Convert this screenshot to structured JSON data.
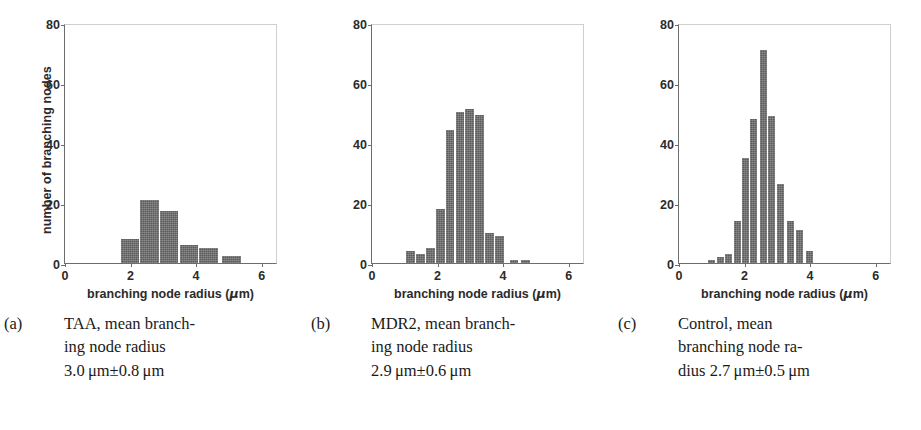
{
  "figure": {
    "panel_count": 3,
    "bar_color": "#5c5c5c",
    "axis_color": "#6d6d6d",
    "background": "#ffffff"
  },
  "axis": {
    "xlabel_prefix": "branching node radius (",
    "xlabel_mu": "μ",
    "xlabel_suffix": "m)",
    "ylabel": "number of branching nodes",
    "xticks": [
      "0",
      "2",
      "4",
      "6"
    ],
    "yticks": [
      "0",
      "20",
      "40",
      "60",
      "80"
    ]
  },
  "panels": [
    {
      "id": "taa",
      "caption_tag": "(a)",
      "caption_text": "TAA, mean branching node radius 3.0 μm±0.8 μm",
      "caption_line1": "TAA, mean branch-",
      "caption_line2": "ing node radius",
      "caption_line3": "3.0 μm±0.8 μm",
      "show_ylabel": true,
      "show_yticklabels": true,
      "mean": 3.0,
      "sd": 0.8
    },
    {
      "id": "mdr2",
      "caption_tag": "(b)",
      "caption_text": "MDR2, mean branching node radius 2.9 μm±0.6 μm",
      "caption_line1": "MDR2, mean branch-",
      "caption_line2": "ing node radius",
      "caption_line3": "2.9 μm±0.6 μm",
      "show_ylabel": false,
      "show_yticklabels": true,
      "mean": 2.9,
      "sd": 0.6
    },
    {
      "id": "control",
      "caption_tag": "(c)",
      "caption_text": "Control, mean branching node radius 2.7 μm±0.5 μm",
      "caption_line1": "Control, mean",
      "caption_line2": "branching node ra-",
      "caption_line3": "dius 2.7 μm±0.5 μm",
      "show_ylabel": false,
      "show_yticklabels": true,
      "mean": 2.7,
      "sd": 0.5
    }
  ],
  "chart_data": [
    {
      "type": "bar",
      "id": "taa",
      "title": "TAA, mean branching node radius 3.0 μm±0.8 μm",
      "xlabel": "branching node radius (μm)",
      "ylabel": "number of branching nodes",
      "xlim": [
        0,
        6.5
      ],
      "ylim": [
        0,
        80
      ],
      "xticks": [
        0,
        2,
        4,
        6
      ],
      "yticks": [
        0,
        20,
        40,
        60,
        80
      ],
      "grid": false,
      "bin_width": 0.6,
      "bin_centers": [
        2.0,
        2.6,
        3.2,
        3.8,
        4.4,
        5.1
      ],
      "bin_left_edges": [
        1.7,
        2.3,
        2.9,
        3.5,
        4.1,
        4.8
      ],
      "values": [
        8,
        21,
        17.5,
        6,
        5,
        2.5
      ]
    },
    {
      "type": "bar",
      "id": "mdr2",
      "title": "MDR2, mean branching node radius 2.9 μm±0.6 μm",
      "xlabel": "branching node radius (μm)",
      "ylabel": "number of branching nodes",
      "xlim": [
        0,
        6.5
      ],
      "ylim": [
        0,
        80
      ],
      "xticks": [
        0,
        2,
        4,
        6
      ],
      "yticks": [
        0,
        20,
        40,
        60,
        80
      ],
      "grid": false,
      "bin_width": 0.3,
      "bin_centers": [
        1.2,
        1.5,
        1.8,
        2.1,
        2.4,
        2.7,
        3.0,
        3.3,
        3.6,
        3.9,
        4.35,
        4.7
      ],
      "bin_left_edges": [
        1.05,
        1.35,
        1.65,
        1.95,
        2.25,
        2.55,
        2.85,
        3.15,
        3.45,
        3.75,
        4.2,
        4.55
      ],
      "values": [
        4,
        3,
        5,
        18,
        44.5,
        50.5,
        51.5,
        49.5,
        10,
        9,
        1,
        1
      ]
    },
    {
      "type": "bar",
      "id": "control",
      "title": "Control, mean branching node radius 2.7 μm±0.5 μm",
      "xlabel": "branching node radius (μm)",
      "ylabel": "number of branching nodes",
      "xlim": [
        0,
        6.5
      ],
      "ylim": [
        0,
        80
      ],
      "xticks": [
        0,
        2,
        4,
        6
      ],
      "yticks": [
        0,
        20,
        40,
        60,
        80
      ],
      "grid": false,
      "bin_width": 0.25,
      "bin_centers": [
        1.0,
        1.25,
        1.5,
        1.8,
        2.05,
        2.3,
        2.6,
        2.85,
        3.15,
        3.45,
        3.7,
        4.0
      ],
      "bin_left_edges": [
        0.9,
        1.15,
        1.4,
        1.68,
        1.93,
        2.18,
        2.46,
        2.73,
        3.0,
        3.3,
        3.58,
        3.88
      ],
      "values": [
        1,
        2,
        3,
        14,
        35,
        48,
        71,
        49,
        26.5,
        14,
        11,
        4
      ]
    }
  ]
}
